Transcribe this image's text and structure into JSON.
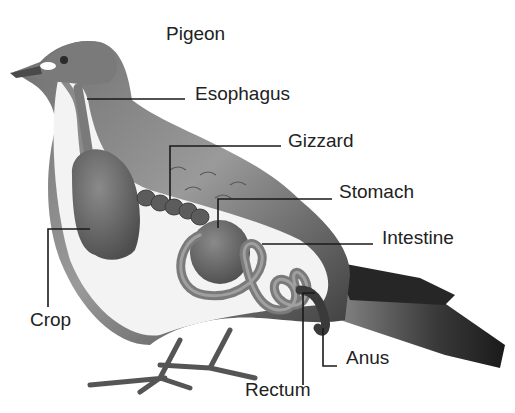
{
  "diagram": {
    "title": "Pigeon",
    "colors": {
      "text": "#222222",
      "leader_line": "#1a1a1a",
      "body_light": "#f2f2f2",
      "body_mid": "#a8a8a8",
      "body_dark": "#555555",
      "organ": "#6a6a6a",
      "tail_dark": "#2a2a2a"
    },
    "labels": [
      {
        "id": "esophagus",
        "text": "Esophagus"
      },
      {
        "id": "gizzard",
        "text": "Gizzard"
      },
      {
        "id": "stomach",
        "text": "Stomach"
      },
      {
        "id": "intestine",
        "text": "Intestine"
      },
      {
        "id": "crop",
        "text": "Crop"
      },
      {
        "id": "anus",
        "text": "Anus"
      },
      {
        "id": "rectum",
        "text": "Rectum"
      }
    ]
  }
}
